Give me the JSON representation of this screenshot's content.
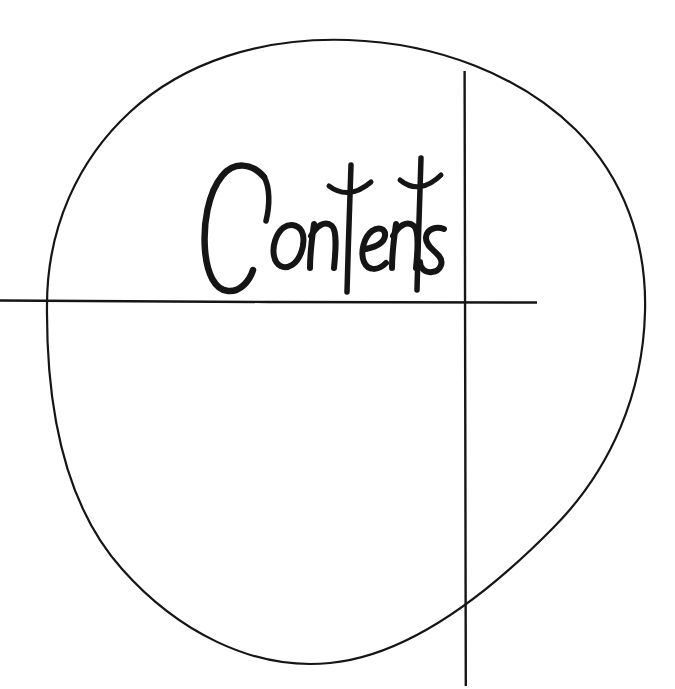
{
  "page": {
    "kind": "book-section-divider",
    "background_color": "#ffffff",
    "ink_color": "#151515",
    "width": 675,
    "height": 689
  },
  "heading": {
    "text": "Contents",
    "style": "handwritten-brush-script",
    "color": "#151515",
    "bounds": {
      "x": 213,
      "y": 155,
      "width": 227,
      "height": 137
    }
  },
  "marks": {
    "circle": {
      "name": "hand-drawn-circle",
      "color": "#151515",
      "stroke_width": 2.2,
      "center_x": 345,
      "center_y": 352,
      "radius_x": 300,
      "radius_y": 312
    },
    "horizontal_rule": {
      "name": "horizontal-rule",
      "color": "#151515",
      "stroke_width": 2.4,
      "x1": 0,
      "y1": 301,
      "x2": 537,
      "y2": 303
    },
    "vertical_rule": {
      "name": "vertical-rule",
      "color": "#151515",
      "stroke_width": 2.4,
      "x1": 465,
      "y1": 71,
      "x2": 466,
      "y2": 686
    }
  }
}
